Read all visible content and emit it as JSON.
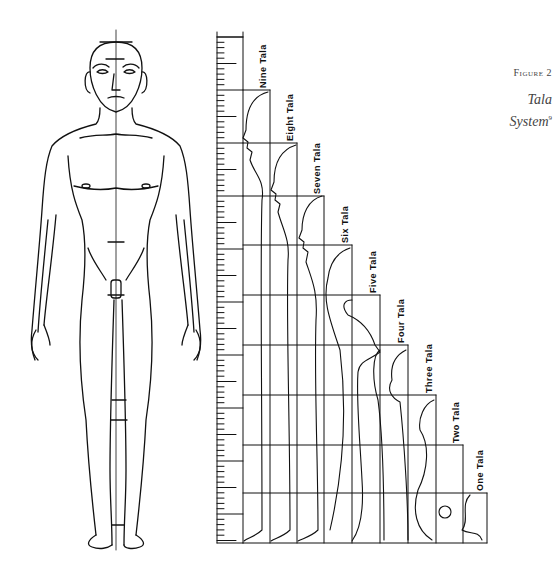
{
  "caption": {
    "figure_label": "Figure 2",
    "title_line1": "Tala",
    "title_line2": "System",
    "footnote_mark": "9"
  },
  "diagram": {
    "type": "proportion-diagram",
    "labels": [
      "Nine Tala",
      "Eight Tala",
      "Seven Tala",
      "Six Tala",
      "Five Tala",
      "Four Tala",
      "Three Tala",
      "Two Tala",
      "One Tala"
    ],
    "figures_in_grid": [
      "human profile (nine tala)",
      "human profile (eight tala)",
      "human profile (seven tala)",
      "human profile (six tala)",
      "lion (five tala)",
      "ganesha (four tala)",
      "dwarf/gana (three tala)",
      "horse/bird (two tala)",
      "ornament/foliage (one tala)"
    ],
    "grid_rows": 10,
    "grid_columns": 9
  }
}
